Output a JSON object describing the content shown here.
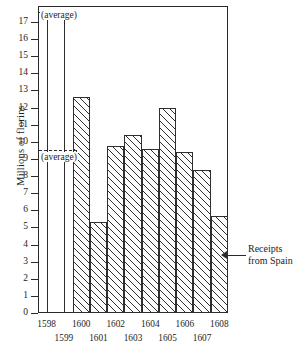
{
  "chart_data": {
    "type": "bar",
    "title": "",
    "subtitle": "",
    "xlabel": "",
    "ylabel": "Millions of florins",
    "categories": [
      "1598",
      "1599",
      "1600",
      "1601",
      "1602",
      "1603",
      "1604",
      "1605",
      "1606",
      "1607",
      "1608"
    ],
    "values": [
      9.5,
      9.5,
      12.6,
      5.3,
      9.75,
      10.4,
      9.6,
      12.0,
      9.4,
      8.35,
      5.65
    ],
    "truncated_bars": [
      "1598",
      "1599"
    ],
    "truncated_note": "Bars for 1598 and 1599 are drawn as narrow spikes that run off the top of the scale (values exceed 17).",
    "ylim": [
      0,
      17
    ],
    "ytick_values": [
      0,
      1,
      2,
      3,
      4,
      5,
      6,
      7,
      8,
      9,
      10,
      11,
      12,
      13,
      14,
      15,
      16,
      17
    ],
    "ytick_labels": [
      "0",
      "1",
      "2",
      "3",
      "4",
      "5",
      "6",
      "7",
      "8",
      "9",
      "10",
      "11",
      "12",
      "13",
      "14",
      "15",
      "16",
      "17"
    ],
    "grid": false,
    "legend_position": "none",
    "annotations": [
      {
        "name": "average-upper",
        "label": "(average)",
        "type": "dashed-reference-line",
        "value": 17.6
      },
      {
        "name": "average-lower",
        "label": "(average)",
        "type": "dashed-reference-line",
        "value": 9.5
      },
      {
        "name": "series-callout",
        "label": "Receipts\nfrom Spain",
        "line1": "Receipts",
        "line2": "from Spain",
        "points_to": "1608"
      }
    ],
    "series": [
      {
        "name": "Receipts from Spain",
        "values": [
          9.5,
          9.5,
          12.6,
          5.3,
          9.75,
          10.4,
          9.6,
          12.0,
          9.4,
          8.35,
          5.65
        ]
      }
    ],
    "colors": {
      "ink": "#2a2a2a",
      "bar_fill": "#fdfdfd",
      "hatch": "#2f2f2f",
      "background": "#ffffff"
    }
  },
  "xaxis": {
    "row_top": [
      "1598",
      "1600",
      "1602",
      "1604",
      "1606",
      "1608"
    ],
    "row_bottom": [
      "1599",
      "1601",
      "1603",
      "1605",
      "1607"
    ]
  },
  "callout": {
    "line1": "Receipts",
    "line2": "from Spain"
  },
  "averages": {
    "upper_label": "(average)",
    "lower_label": "(average)"
  }
}
